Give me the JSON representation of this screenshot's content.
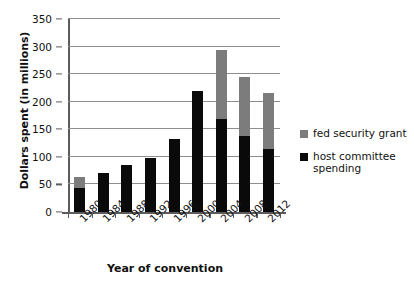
{
  "chart_data": {
    "type": "bar",
    "title": "",
    "subtitle": "",
    "xlabel": "Year of convention",
    "ylabel": "Dollars spent (in millions)",
    "categories": [
      "1980",
      "1984",
      "1988",
      "1992",
      "1996",
      "2000",
      "2004",
      "2008",
      "2012"
    ],
    "series": [
      {
        "name": "host committee spending",
        "color": "#0a0a0a",
        "values": [
          43,
          71,
          86,
          98,
          133,
          220,
          168,
          138,
          114
        ]
      },
      {
        "name": "fed security grant",
        "color": "#7c7c7c",
        "values": [
          20,
          0,
          0,
          0,
          0,
          0,
          125,
          107,
          102
        ]
      }
    ],
    "totals": [
      63,
      71,
      86,
      98,
      133,
      220,
      293,
      245,
      216
    ],
    "stacked": true,
    "ylim": [
      0,
      350
    ],
    "yticks": [
      0,
      50,
      100,
      150,
      200,
      250,
      300,
      350
    ],
    "ytick_labels": [
      "0",
      "50",
      "100",
      "150",
      "200",
      "250",
      "300",
      "350"
    ],
    "grid": "horizontal",
    "legend_position": "right",
    "legend": [
      {
        "label": "fed security grant",
        "color": "#7c7c7c"
      },
      {
        "label": "host committee spending",
        "color": "#0a0a0a"
      }
    ],
    "colors": {
      "host": "#0a0a0a",
      "fed": "#7c7c7c",
      "grid": "#8e8e8e",
      "axis": "#5c5c5c",
      "background": "#ffffff"
    }
  }
}
